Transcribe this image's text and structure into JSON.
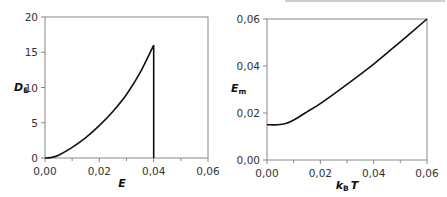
{
  "chart_data": [
    {
      "type": "line",
      "title": "",
      "xlabel": "E",
      "ylabel": "D_E",
      "ylabel_main": "D",
      "ylabel_sub": "E",
      "xlim": [
        0,
        0.06
      ],
      "ylim": [
        0,
        20
      ],
      "x_ticks": [
        "0,00",
        "0,02",
        "0,04",
        "0,06"
      ],
      "y_ticks": [
        "0",
        "5",
        "10",
        "15",
        "20"
      ],
      "grid": false,
      "legend": null,
      "series": [
        {
          "name": "D_E",
          "x": [
            0.0,
            0.002,
            0.005,
            0.01,
            0.015,
            0.02,
            0.025,
            0.03,
            0.035,
            0.04,
            0.04
          ],
          "y": [
            0.0,
            0.05,
            0.4,
            1.5,
            2.9,
            4.6,
            6.6,
            9.0,
            12.1,
            16.0,
            0.0
          ]
        }
      ]
    },
    {
      "type": "line",
      "title": "",
      "xlabel": "k_B T",
      "xlabel_main_1": "k",
      "xlabel_sub": "B",
      "xlabel_main_2": "T",
      "ylabel": "E_m",
      "ylabel_main": "E",
      "ylabel_sub": "m",
      "xlim": [
        0,
        0.06
      ],
      "ylim": [
        0,
        0.06
      ],
      "x_ticks": [
        "0,00",
        "0,02",
        "0,04",
        "0,06"
      ],
      "y_ticks": [
        "0,00",
        "0,02",
        "0,04",
        "0,06"
      ],
      "grid": false,
      "legend": null,
      "series": [
        {
          "name": "E_m",
          "x": [
            0.0,
            0.004,
            0.007,
            0.01,
            0.015,
            0.02,
            0.03,
            0.04,
            0.05,
            0.06
          ],
          "y": [
            0.015,
            0.015,
            0.0155,
            0.017,
            0.0205,
            0.024,
            0.0322,
            0.0408,
            0.0503,
            0.06
          ]
        }
      ]
    }
  ]
}
